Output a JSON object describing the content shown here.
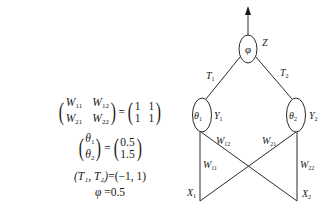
{
  "diagram": {
    "type": "neural-network",
    "nodes": {
      "output": {
        "symbol": "φ",
        "label": "Z"
      },
      "hidden1": {
        "symbol": "θ",
        "sub": "1",
        "label": "Y",
        "label_sub": "1"
      },
      "hidden2": {
        "symbol": "θ",
        "sub": "2",
        "label": "Y",
        "label_sub": "2"
      },
      "input1": {
        "label": "X",
        "label_sub": "1"
      },
      "input2": {
        "label": "X",
        "label_sub": "2"
      }
    },
    "edges": {
      "t1": {
        "label": "T",
        "sub": "1"
      },
      "t2": {
        "label": "T",
        "sub": "2"
      },
      "w11": {
        "label": "W",
        "sub": "11"
      },
      "w12": {
        "label": "W",
        "sub": "12"
      },
      "w21": {
        "label": "W",
        "sub": "21"
      },
      "w22": {
        "label": "W",
        "sub": "22"
      }
    },
    "line_color": "#2a2a2a"
  },
  "equations": {
    "weights": {
      "lhs": [
        [
          "W",
          "11"
        ],
        [
          "W",
          "12"
        ],
        [
          "W",
          "21"
        ],
        [
          "W",
          "22"
        ]
      ],
      "rhs": [
        "1",
        "1",
        "1",
        "1"
      ]
    },
    "thresholds": {
      "lhs": [
        [
          "θ",
          "1"
        ],
        [
          "θ",
          "2"
        ]
      ],
      "rhs": [
        "0.5",
        "1.5"
      ]
    },
    "t_values": {
      "lhs": "(T₁, T₂)",
      "rhs": "(−1, 1)"
    },
    "phi": {
      "lhs": "φ",
      "rhs": "0.5"
    },
    "equals": "="
  }
}
